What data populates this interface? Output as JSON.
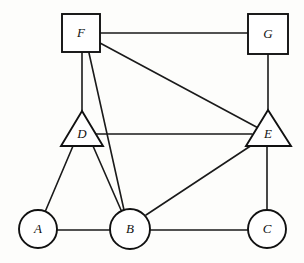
{
  "diagram": {
    "background_color": "#fdfdfb",
    "stroke_color": "#111111",
    "node_fill_color": "#ffffff",
    "width": 304,
    "height": 263,
    "nodes": [
      {
        "id": "F",
        "label": "F",
        "shape": "square",
        "cx": 81,
        "cy": 33,
        "size": 38,
        "x": 62,
        "y": 14,
        "label_x": 81,
        "label_y": 34
      },
      {
        "id": "G",
        "label": "G",
        "shape": "square",
        "cx": 268,
        "cy": 34,
        "size": 40,
        "x": 248,
        "y": 14,
        "label_x": 268,
        "label_y": 35
      },
      {
        "id": "D",
        "label": "D",
        "shape": "triangle",
        "cx": 82,
        "cy": 134,
        "apex_x": 82,
        "apex_y": 111,
        "base_left_x": 61,
        "base_right_x": 103,
        "base_y": 146,
        "label_x": 82,
        "label_y": 135
      },
      {
        "id": "E",
        "label": "E",
        "shape": "triangle",
        "cx": 268,
        "cy": 134,
        "apex_x": 268,
        "apex_y": 110,
        "base_left_x": 246,
        "base_right_x": 291,
        "base_y": 146,
        "label_x": 268,
        "label_y": 135
      },
      {
        "id": "A",
        "label": "A",
        "shape": "circle",
        "cx": 38,
        "cy": 229,
        "r": 19,
        "label_x": 38,
        "label_y": 230
      },
      {
        "id": "B",
        "label": "B",
        "shape": "circle",
        "cx": 130,
        "cy": 229,
        "r": 20,
        "label_x": 130,
        "label_y": 230
      },
      {
        "id": "C",
        "label": "C",
        "shape": "circle",
        "cx": 267,
        "cy": 229,
        "r": 19,
        "label_x": 267,
        "label_y": 230
      }
    ],
    "edges": [
      {
        "id": "F-G",
        "from": "F",
        "to": "G",
        "x1": 100,
        "y1": 33,
        "x2": 248,
        "y2": 33
      },
      {
        "id": "F-D",
        "from": "F",
        "to": "D",
        "x1": 82,
        "y1": 53,
        "x2": 82,
        "y2": 112
      },
      {
        "id": "F-B",
        "from": "F",
        "to": "B",
        "x1": 89,
        "y1": 53,
        "x2": 124,
        "y2": 210
      },
      {
        "id": "F-E",
        "from": "F",
        "to": "E",
        "x1": 100,
        "y1": 43,
        "x2": 262,
        "y2": 130
      },
      {
        "id": "D-E",
        "from": "D",
        "to": "E",
        "x1": 93,
        "y1": 134,
        "x2": 252,
        "y2": 134
      },
      {
        "id": "D-A",
        "from": "D",
        "to": "A",
        "x1": 73,
        "y1": 146,
        "x2": 45,
        "y2": 212
      },
      {
        "id": "D-B",
        "from": "D",
        "to": "B",
        "x1": 93,
        "y1": 146,
        "x2": 121,
        "y2": 210
      },
      {
        "id": "G-E",
        "from": "G",
        "to": "E",
        "x1": 268,
        "y1": 54,
        "x2": 268,
        "y2": 111
      },
      {
        "id": "E-B",
        "from": "E",
        "to": "B",
        "x1": 255,
        "y1": 143,
        "x2": 146,
        "y2": 215
      },
      {
        "id": "E-C",
        "from": "E",
        "to": "C",
        "x1": 267,
        "y1": 146,
        "x2": 267,
        "y2": 210
      },
      {
        "id": "A-B",
        "from": "A",
        "to": "B",
        "x1": 57,
        "y1": 230,
        "x2": 110,
        "y2": 230
      },
      {
        "id": "B-C",
        "from": "B",
        "to": "C",
        "x1": 150,
        "y1": 230,
        "x2": 248,
        "y2": 230
      }
    ]
  }
}
